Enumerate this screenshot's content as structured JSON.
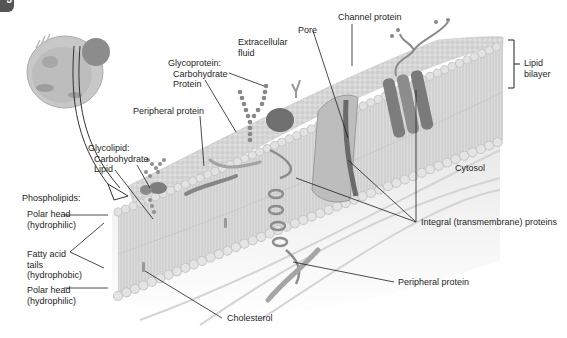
{
  "figure": {
    "badge": "3",
    "colors": {
      "membrane_fill": "#d9d9d9",
      "membrane_head": "#cfcfcf",
      "protein": "#9a9a9a",
      "protein_dark": "#7a7a7a",
      "leader_line": "#1e1e1e",
      "cytosol_fill": "#ececec"
    }
  },
  "labels": {
    "extracellular": {
      "line1": "Extracellular",
      "line2": "fluid"
    },
    "pore": "Pore",
    "channel_protein": "Channel protein",
    "glycoprotein": {
      "line1": "Glycoprotein:",
      "line2": "Carbohydrate",
      "line3": "Protein"
    },
    "peripheral_protein_top": "Peripheral protein",
    "glycolipid": {
      "line1": "Glycolipid:",
      "line2": "Carbohydrate",
      "line3": "Lipid"
    },
    "lipid_bilayer": {
      "line1": "Lipid",
      "line2": "bilayer"
    },
    "cytosol": "Cytosol",
    "phospholipids": "Phospholipids:",
    "polar_head_top": {
      "line1": "Polar head",
      "line2": "(hydrophilic)"
    },
    "fatty_acid_tails": {
      "line1": "Fatty acid",
      "line2": "tails",
      "line3": "(hydrophobic)"
    },
    "polar_head_bottom": {
      "line1": "Polar head",
      "line2": "(hydrophilic)"
    },
    "integral_proteins": "Integral (transmembrane) proteins",
    "peripheral_protein_bottom": "Peripheral protein",
    "cholesterol": "Cholesterol"
  }
}
